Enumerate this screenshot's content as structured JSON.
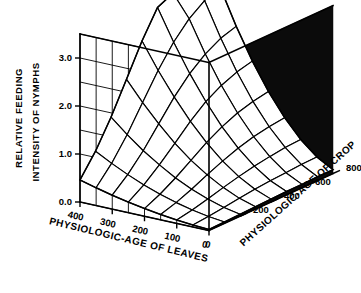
{
  "chart_data": {
    "type": "surface",
    "title": "",
    "subtitle": "",
    "zlabel_line1": "RELATIVE FEEDING",
    "zlabel_line2": "INTENSITY OF NYMPHS",
    "xlabel": "PHYSIOLOGIC-AGE  OF  LEAVES",
    "ylabel": "PHYSIOLOGIC-AGE  OF  CROP",
    "zlabel": "RELATIVE FEEDING INTENSITY OF NYMPHS",
    "grid": true,
    "legend": "none",
    "projection": "3d-wireframe-surface",
    "xticks": [
      400,
      300,
      200,
      100,
      0
    ],
    "xtick_labels": [
      "400",
      "300",
      "200",
      "100",
      "0"
    ],
    "xlim": [
      0,
      400
    ],
    "x_axis_direction": "decreasing-left-to-right",
    "yticks": [
      200,
      400,
      600,
      800
    ],
    "ytick_labels": [
      "200",
      "400",
      "600",
      "800"
    ],
    "ylim": [
      0,
      800
    ],
    "zticks": [
      0.0,
      1.0,
      2.0,
      3.0
    ],
    "ztick_labels": [
      "0.0",
      "1.0",
      "2.0",
      "3.0"
    ],
    "zlim": [
      0,
      3.5
    ],
    "z_minor_step": 0.5,
    "x_grid_divisions": 8,
    "y_grid_divisions": 8,
    "surface_color": "#ffffff",
    "mesh_color": "#000000",
    "wall_color": "#0b0b0b",
    "background_color": "#ffffff",
    "x": [
      0,
      50,
      100,
      150,
      200,
      250,
      300,
      350,
      400
    ],
    "y": [
      0,
      100,
      200,
      300,
      400,
      500,
      600,
      700,
      800
    ],
    "z": [
      [
        0.02,
        0.04,
        0.07,
        0.11,
        0.16,
        0.22,
        0.29,
        0.37,
        0.46
      ],
      [
        0.03,
        0.07,
        0.13,
        0.21,
        0.31,
        0.43,
        0.57,
        0.73,
        0.91
      ],
      [
        0.04,
        0.11,
        0.21,
        0.34,
        0.5,
        0.7,
        0.92,
        1.18,
        1.47
      ],
      [
        0.05,
        0.15,
        0.3,
        0.49,
        0.72,
        1.0,
        1.33,
        1.7,
        2.11
      ],
      [
        0.06,
        0.19,
        0.38,
        0.63,
        0.94,
        1.31,
        1.74,
        2.22,
        2.76
      ],
      [
        0.07,
        0.22,
        0.45,
        0.75,
        1.12,
        1.57,
        2.08,
        2.66,
        3.31
      ],
      [
        0.07,
        0.24,
        0.5,
        0.84,
        1.26,
        1.76,
        2.34,
        3.0,
        3.46
      ],
      [
        0.08,
        0.26,
        0.54,
        0.9,
        1.35,
        1.89,
        2.52,
        3.23,
        3.49
      ],
      [
        0.08,
        0.27,
        0.56,
        0.94,
        1.41,
        1.97,
        2.62,
        3.36,
        3.5
      ]
    ]
  },
  "figure": {
    "axis_titles": {
      "x": "PHYSIOLOGIC-AGE  OF  LEAVES",
      "y": "PHYSIOLOGIC-AGE  OF  CROP",
      "z_line1": "RELATIVE FEEDING",
      "z_line2": "INTENSITY OF NYMPHS"
    }
  }
}
